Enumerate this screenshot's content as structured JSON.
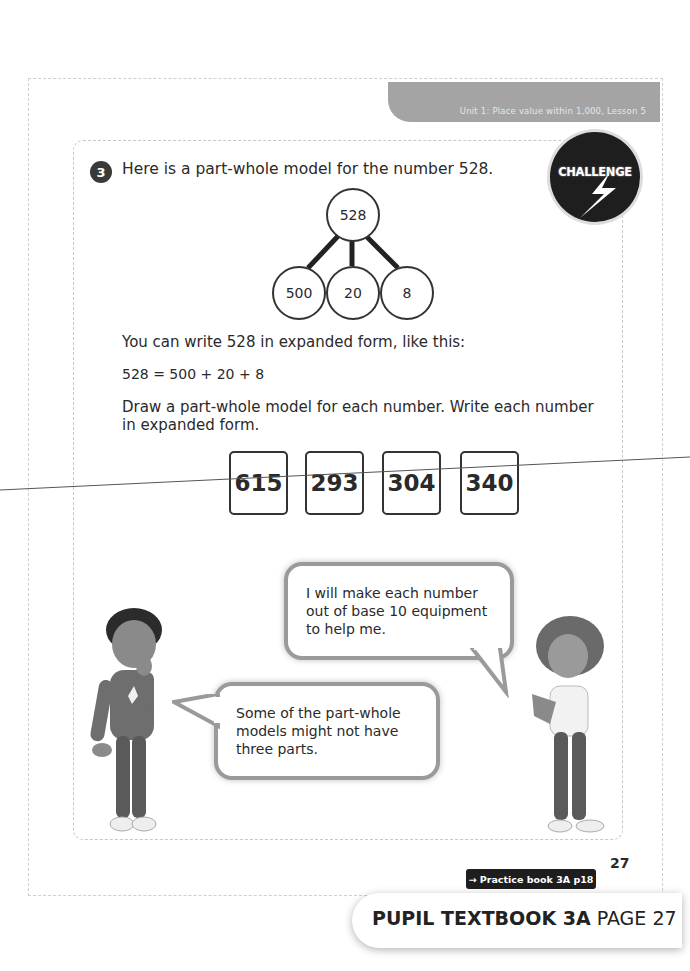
{
  "header": {
    "breadcrumb": "Unit 1: Place value within 1,000, Lesson 5"
  },
  "question": {
    "number": "3",
    "prompt": "Here is a part-whole model for the number 528.",
    "badge": "CHALLENGE"
  },
  "part_whole_model": {
    "whole": "528",
    "parts": [
      "500",
      "20",
      "8"
    ]
  },
  "body": {
    "line1": "You can write 528 in expanded form, like this:",
    "equation": "528 = 500 + 20 + 8",
    "instruction_line1": "Draw a part-whole model for each number. Write each number",
    "instruction_line2": "in expanded form."
  },
  "number_cards": [
    "615",
    "293",
    "304",
    "340"
  ],
  "speech": {
    "girl_line1": "I will make each number",
    "girl_line2": "out of base 10 equipment",
    "girl_line3": "to help me.",
    "boy_line1": "Some of the part-whole",
    "boy_line2": "models might not have",
    "boy_line3": "three parts."
  },
  "footer": {
    "page_number": "27",
    "practice_link": "→ Practice book 3A p18",
    "book_title": "PUPIL TEXTBOOK 3A",
    "page_label": "PAGE 27"
  }
}
